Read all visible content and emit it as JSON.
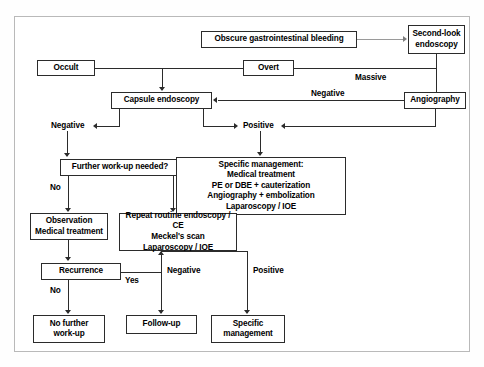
{
  "figure": {
    "kind": "clinical-algorithm-flowchart",
    "title_visible": false,
    "frame": {
      "border_color": "#b9b9b9",
      "background": "#ffffff"
    },
    "line_color": "#2b2b2b",
    "text_color": "#000000"
  },
  "nodes": {
    "obscure_bleeding": {
      "label": "Obscure gastrointestinal bleeding"
    },
    "second_look": {
      "label": "Second-look\nendoscopy"
    },
    "occult": {
      "label": "Occult"
    },
    "overt": {
      "label": "Overt"
    },
    "capsule": {
      "label": "Capsule endoscopy"
    },
    "angiography": {
      "label": "Angiography"
    },
    "further_workup": {
      "label": "Further work-up needed?"
    },
    "specific_mgmt_detail": {
      "label": "Specific management:\nMedical treatment\nPE or DBE + cauterization\nAngiography + embolization\nLaparoscopy / IOE"
    },
    "observation": {
      "label": "Observation\nMedical treatment"
    },
    "repeat_routine": {
      "label": "Repeat routine endoscopy / CE\nMeckel's scan\nLaparoscopy / IOE"
    },
    "recurrence": {
      "label": "Recurrence"
    },
    "no_further_workup": {
      "label": "No further\nwork-up"
    },
    "follow_up": {
      "label": "Follow-up"
    },
    "specific_management": {
      "label": "Specific\nmanagement"
    }
  },
  "edge_labels": {
    "massive": "Massive",
    "negative_from_angiography": "Negative",
    "negative_left": "Negative",
    "positive": "Positive",
    "no_workup": "No",
    "yes_workup": "Yes",
    "yes_recurrence": "Yes",
    "no_recurrence": "No",
    "negative_repeat": "Negative",
    "positive_repeat": "Positive"
  }
}
